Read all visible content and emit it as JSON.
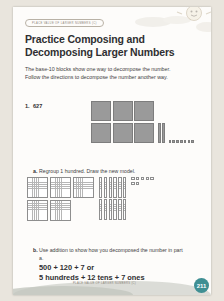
{
  "badge": {
    "text": "PLACE VALUE OF LARGER NUMBERS (C)"
  },
  "title": {
    "text": "Practice Composing and Decomposing Larger Numbers"
  },
  "intro": {
    "text": "The base-10 blocks show one way to decompose the number. Follow the directions to decompose the number another way."
  },
  "problem": {
    "number": "1.",
    "value": "627"
  },
  "parts": {
    "a": {
      "label": "a.",
      "text": "Regroup 1 hundred. Draw the new model."
    },
    "b": {
      "label": "b.",
      "text": "Use addition to show how you decomposed the number in part a.",
      "equation_1": "500 + 120 + 7 or",
      "equation_2": "5 hundreds + 12 tens + 7 ones"
    }
  },
  "blocks": {
    "given": {
      "hundreds": 6,
      "tens": 2,
      "ones": 7
    },
    "regrouped": {
      "hundreds": 5,
      "tens": 12,
      "ones": 7
    }
  },
  "footer": {
    "text": "PLACE VALUE OF LARGER NUMBERS (C)",
    "page_number": "211",
    "accent_color": "#3f8f93"
  }
}
